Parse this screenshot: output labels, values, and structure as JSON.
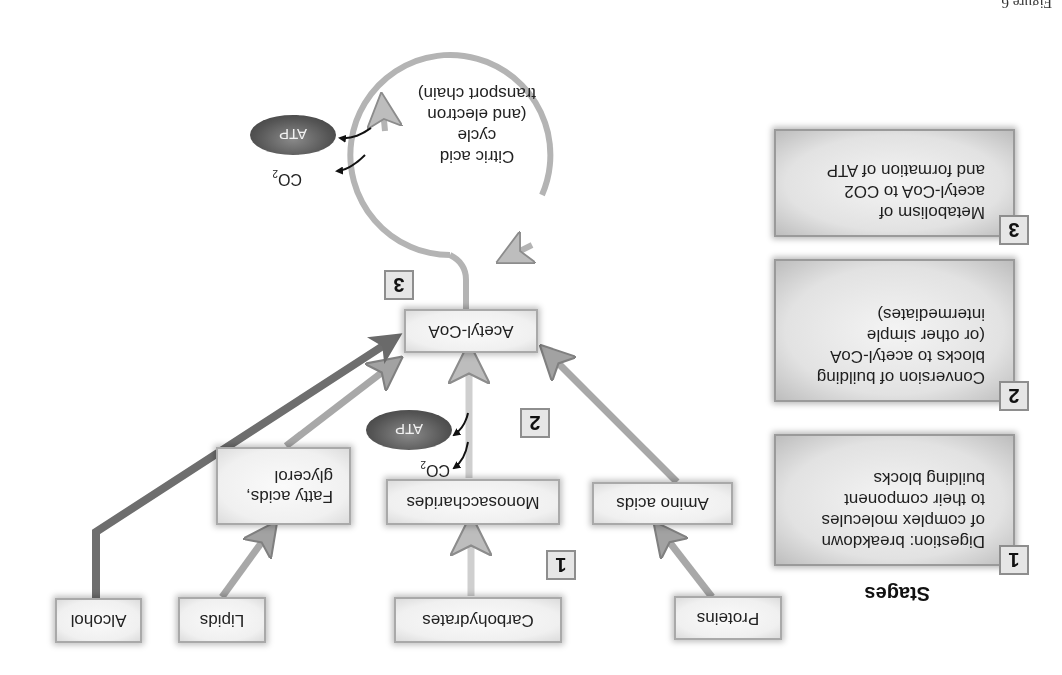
{
  "figure": {
    "orientation": "rotated 180 degrees",
    "caption_fragment": "Figure 6"
  },
  "stages": {
    "title": "Stages",
    "items": [
      {
        "number": "1",
        "text_lines": [
          "Digestion: breakdown",
          "of complex molecules",
          "to their component",
          "building blocks"
        ]
      },
      {
        "number": "2",
        "text_lines": [
          "Conversion of building",
          "blocks to acetyl-CoA",
          "(or other simple",
          "intermediates)"
        ]
      },
      {
        "number": "3",
        "text_lines": [
          "Metabolism of",
          "acetyl-CoA to CO2",
          "and formation of ATP"
        ]
      }
    ]
  },
  "diagram": {
    "sources": {
      "proteins": "Proteins",
      "carbohydrates": "Carbohydrates",
      "lipids": "Lipids",
      "alcohol": "Alcohol"
    },
    "building_blocks": {
      "amino_acids": "Amino acids",
      "monosaccharides": "Monosaccharides",
      "fatty_acids_line1": "Fatty acids,",
      "fatty_acids_line2": "glycerol"
    },
    "acetyl_coa": "Acetyl-CoA",
    "cycle": {
      "lines": [
        "Citric acid",
        "cycle",
        "(and electron",
        "transport chain)"
      ]
    },
    "products": {
      "atp": "ATP",
      "co2_base": "CO",
      "co2_sub": "2"
    },
    "stage_markers": [
      "1",
      "2",
      "3"
    ]
  },
  "colors": {
    "arrow_light": "#c8c8c8",
    "arrow_medium": "#a8a8a8",
    "arrow_dark": "#6e6e6e",
    "box_border": "#a9a9a9",
    "atp_fill": "#555555"
  }
}
